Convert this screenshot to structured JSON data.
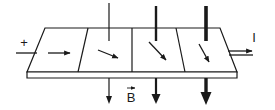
{
  "diagram": {
    "labels": {
      "plus": "+",
      "current": "I",
      "field": "B"
    },
    "segments": [
      {
        "id": 1,
        "field_strength": "none",
        "arrow_direction": "right"
      },
      {
        "id": 2,
        "field_strength": "weak",
        "arrow_direction": "down-right"
      },
      {
        "id": 3,
        "field_strength": "medium",
        "arrow_direction": "down-right-steep"
      },
      {
        "id": 4,
        "field_strength": "strong",
        "arrow_direction": "down-right-steeper"
      }
    ],
    "colors": {
      "stroke": "#1a1a1a",
      "background": "#ffffff"
    }
  }
}
